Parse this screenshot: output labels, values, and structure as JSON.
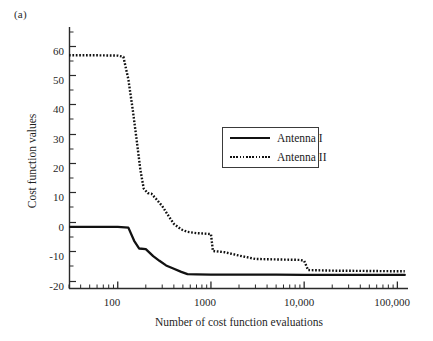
{
  "figure": {
    "panel_label": "(a)",
    "xlabel": "Number of cost function evaluations",
    "ylabel": "Cost function values"
  },
  "legend": {
    "entries": [
      {
        "label": "Antenna I",
        "style": "solid"
      },
      {
        "label": "Antenna II",
        "style": "dotted"
      }
    ]
  },
  "ticks": {
    "y": [
      "60",
      "50",
      "40",
      "30",
      "20",
      "10",
      "0",
      "-10",
      "-20"
    ],
    "x": [
      "100",
      "1000",
      "10,000",
      "100,000"
    ]
  },
  "chart_data": {
    "type": "line",
    "title": "",
    "subtitle": "",
    "panel": "(a)",
    "xlabel": "Number of cost function evaluations",
    "ylabel": "Cost function values",
    "xscale": "log",
    "yscale": "linear",
    "xlim": [
      30,
      130000
    ],
    "ylim": [
      -20,
      65
    ],
    "yticks": [
      -20,
      -10,
      0,
      10,
      20,
      30,
      40,
      50,
      60
    ],
    "ytick_labels": [
      "-20",
      "-10",
      "0",
      "10",
      "20",
      "30",
      "40",
      "50",
      "60"
    ],
    "xticks": [
      100,
      1000,
      10000,
      100000
    ],
    "xtick_labels": [
      "100",
      "1000",
      "10,000",
      "100,000"
    ],
    "grid": false,
    "legend_position": "upper right inside",
    "minor_ticks": "log decades",
    "series": [
      {
        "name": "Antenna I",
        "style": "solid",
        "color": "#111111",
        "x": [
          30,
          60,
          100,
          130,
          150,
          170,
          200,
          240,
          280,
          330,
          400,
          480,
          560,
          700,
          1000,
          2000,
          5000,
          10000,
          30000,
          60000,
          100000,
          120000
        ],
        "y": [
          0.0,
          0.0,
          0.0,
          -0.2,
          -4.5,
          -7.0,
          -7.2,
          -9.5,
          -11.0,
          -12.5,
          -13.6,
          -14.6,
          -15.3,
          -15.4,
          -15.5,
          -15.5,
          -15.5,
          -15.6,
          -15.6,
          -15.6,
          -15.6,
          -15.6
        ]
      },
      {
        "name": "Antenna II",
        "style": "dotted",
        "color": "#111111",
        "x": [
          30,
          60,
          100,
          115,
          130,
          145,
          160,
          175,
          190,
          210,
          230,
          260,
          300,
          340,
          400,
          480,
          560,
          700,
          900,
          1000,
          1050,
          1400,
          2000,
          3000,
          6000,
          9000,
          10000,
          11000,
          20000,
          50000,
          100000,
          120000
        ],
        "y": [
          55.8,
          55.8,
          55.7,
          55.3,
          48.0,
          38.0,
          28.0,
          18.5,
          12.5,
          11.0,
          10.8,
          9.0,
          6.8,
          4.2,
          1.0,
          -0.8,
          -1.6,
          -2.0,
          -2.2,
          -2.3,
          -7.8,
          -8.2,
          -9.3,
          -10.4,
          -10.6,
          -10.7,
          -11.0,
          -14.0,
          -14.2,
          -14.3,
          -14.4,
          -14.4
        ]
      }
    ]
  },
  "colors": {
    "line": "#111111",
    "axis": "#2a2a2a",
    "background": "#ffffff"
  }
}
